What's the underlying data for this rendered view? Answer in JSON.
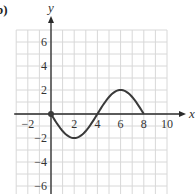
{
  "part_label": "b)",
  "chart_data": {
    "type": "line",
    "title": "",
    "xlabel": "x",
    "ylabel": "y",
    "xlim": [
      -3,
      10
    ],
    "ylim": [
      -7,
      7
    ],
    "grid": true,
    "x_ticks": [
      -2,
      2,
      4,
      6,
      8,
      10
    ],
    "x_tick_labels": [
      "−2",
      "2",
      "4",
      "6",
      "8",
      "10"
    ],
    "y_ticks": [
      6,
      4,
      2,
      -2,
      -4,
      -6
    ],
    "y_tick_labels": [
      "6",
      "4",
      "2",
      "−2",
      "−4",
      "−6"
    ],
    "series": [
      {
        "name": "curve",
        "description": "sine-like curve from (0,0) down to minimum (2,-2), up through (4,0) to maximum (6,2), back to (8,0)",
        "points": [
          [
            0,
            0
          ],
          [
            1,
            -1.41
          ],
          [
            2,
            -2
          ],
          [
            3,
            -1.41
          ],
          [
            4,
            0
          ],
          [
            5,
            1.41
          ],
          [
            6,
            2
          ],
          [
            7,
            1.41
          ],
          [
            8,
            0
          ]
        ]
      }
    ],
    "marked_points": [
      [
        0,
        0
      ]
    ],
    "colors": {
      "curve": "#3a3a3a",
      "axis": "#2a2a2a",
      "grid": "#d8d8d8"
    }
  }
}
